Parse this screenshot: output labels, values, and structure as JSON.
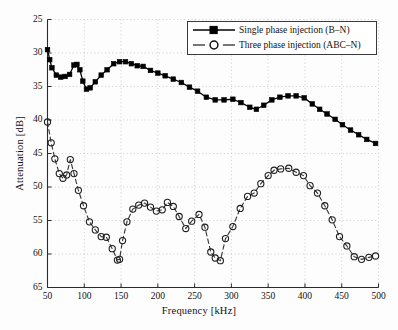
{
  "chart_data": {
    "type": "line",
    "title": "",
    "xlabel": "Frequency [kHz]",
    "ylabel": "Attenuation [dB]",
    "xlim": [
      50,
      500
    ],
    "ylim": [
      25,
      65
    ],
    "y_inverted": true,
    "xticks": [
      50,
      100,
      150,
      200,
      250,
      300,
      350,
      400,
      450,
      500
    ],
    "yticks": [
      25,
      30,
      35,
      40,
      45,
      50,
      55,
      60,
      65
    ],
    "grid": true,
    "grid_style": "dotted",
    "legend_position": "top-right",
    "series": [
      {
        "name": "Single phase injection (B–N)",
        "marker": "filled-square",
        "linestyle": "solid",
        "color": "#000000",
        "points": [
          [
            50,
            29.5
          ],
          [
            53,
            31.0
          ],
          [
            56,
            32.2
          ],
          [
            62,
            33.3
          ],
          [
            68,
            33.6
          ],
          [
            74,
            33.5
          ],
          [
            80,
            33.2
          ],
          [
            86,
            31.8
          ],
          [
            90,
            31.7
          ],
          [
            94,
            32.5
          ],
          [
            98,
            34.2
          ],
          [
            103,
            35.4
          ],
          [
            108,
            35.2
          ],
          [
            115,
            34.3
          ],
          [
            123,
            33.3
          ],
          [
            131,
            32.5
          ],
          [
            140,
            31.6
          ],
          [
            148,
            31.3
          ],
          [
            156,
            31.3
          ],
          [
            164,
            31.6
          ],
          [
            172,
            31.9
          ],
          [
            180,
            32.0
          ],
          [
            190,
            32.6
          ],
          [
            200,
            33.0
          ],
          [
            210,
            33.4
          ],
          [
            221,
            33.9
          ],
          [
            232,
            34.4
          ],
          [
            243,
            35.1
          ],
          [
            254,
            35.7
          ],
          [
            266,
            36.6
          ],
          [
            278,
            37.0
          ],
          [
            290,
            37.0
          ],
          [
            302,
            36.9
          ],
          [
            313,
            37.4
          ],
          [
            325,
            38.1
          ],
          [
            334,
            38.4
          ],
          [
            344,
            37.8
          ],
          [
            355,
            37.0
          ],
          [
            366,
            36.6
          ],
          [
            377,
            36.4
          ],
          [
            388,
            36.4
          ],
          [
            399,
            36.7
          ],
          [
            410,
            37.6
          ],
          [
            420,
            38.4
          ],
          [
            430,
            39.1
          ],
          [
            441,
            39.9
          ],
          [
            451,
            40.7
          ],
          [
            462,
            41.5
          ],
          [
            473,
            42.2
          ],
          [
            484,
            42.9
          ],
          [
            496,
            43.5
          ]
        ]
      },
      {
        "name": "Three phase injection (ABC–N)",
        "marker": "open-circle",
        "linestyle": "dashed",
        "color": "#3a3a3a",
        "points": [
          [
            50,
            40.3
          ],
          [
            55,
            43.4
          ],
          [
            60,
            45.8
          ],
          [
            66,
            48.0
          ],
          [
            71,
            48.7
          ],
          [
            76,
            48.2
          ],
          [
            81,
            45.9
          ],
          [
            86,
            48.0
          ],
          [
            92,
            50.5
          ],
          [
            99,
            52.8
          ],
          [
            107,
            55.2
          ],
          [
            115,
            56.4
          ],
          [
            123,
            57.4
          ],
          [
            130,
            57.5
          ],
          [
            138,
            59.2
          ],
          [
            145,
            60.9
          ],
          [
            148,
            60.8
          ],
          [
            152,
            58.0
          ],
          [
            158,
            55.2
          ],
          [
            166,
            53.3
          ],
          [
            174,
            52.7
          ],
          [
            182,
            52.4
          ],
          [
            190,
            53.0
          ],
          [
            198,
            53.6
          ],
          [
            206,
            53.4
          ],
          [
            213,
            52.3
          ],
          [
            221,
            52.9
          ],
          [
            229,
            54.4
          ],
          [
            238,
            56.2
          ],
          [
            246,
            55.1
          ],
          [
            256,
            54.1
          ],
          [
            264,
            56.0
          ],
          [
            272,
            59.7
          ],
          [
            278,
            60.6
          ],
          [
            285,
            61.0
          ],
          [
            292,
            57.7
          ],
          [
            302,
            55.9
          ],
          [
            312,
            53.2
          ],
          [
            322,
            51.4
          ],
          [
            331,
            50.9
          ],
          [
            340,
            49.5
          ],
          [
            350,
            48.3
          ],
          [
            358,
            47.5
          ],
          [
            367,
            47.3
          ],
          [
            378,
            47.2
          ],
          [
            388,
            47.8
          ],
          [
            398,
            48.3
          ],
          [
            407,
            49.8
          ],
          [
            417,
            50.9
          ],
          [
            427,
            52.8
          ],
          [
            437,
            54.9
          ],
          [
            447,
            57.4
          ],
          [
            457,
            58.8
          ],
          [
            467,
            60.4
          ],
          [
            477,
            60.8
          ],
          [
            487,
            60.5
          ],
          [
            496,
            60.3
          ]
        ]
      }
    ]
  },
  "legend": {
    "entries": [
      {
        "label": "Single phase injection (B–N)"
      },
      {
        "label": "Three phase injection (ABC–N)"
      }
    ]
  },
  "axes": {
    "x_title": "Frequency [kHz]",
    "y_title": "Attenuation [dB]"
  }
}
